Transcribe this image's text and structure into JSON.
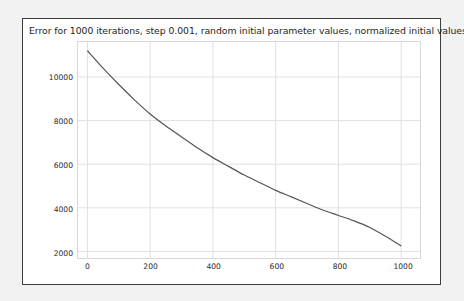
{
  "figure": {
    "background_color": "#ffffff",
    "outer_background_color": "#f2f2f2",
    "border_color": "#3d3d3d"
  },
  "chart_data": {
    "type": "line",
    "title": "Error for 1000 iterations, step 0.001, random initial parameter values, normalized initial values",
    "xlabel": "",
    "ylabel": "",
    "xlim": [
      -30,
      1060
    ],
    "ylim": [
      1700,
      11600
    ],
    "grid": true,
    "legend": null,
    "line_color": "#555555",
    "grid_color": "#e0e0e0",
    "xticks": [
      0,
      200,
      400,
      600,
      800,
      1000
    ],
    "xtick_labels": [
      "0",
      "200",
      "400",
      "600",
      "800",
      "1000"
    ],
    "yticks": [
      2000,
      4000,
      6000,
      8000,
      10000
    ],
    "ytick_labels": [
      "2000",
      "4000",
      "6000",
      "8000",
      "10000"
    ],
    "series": [
      {
        "name": "error",
        "x": [
          0,
          50,
          100,
          150,
          200,
          250,
          300,
          350,
          400,
          450,
          500,
          550,
          600,
          650,
          700,
          750,
          800,
          850,
          900,
          950,
          1000
        ],
        "values": [
          11200,
          10400,
          9650,
          8950,
          8300,
          7750,
          7250,
          6750,
          6300,
          5900,
          5500,
          5150,
          4800,
          4500,
          4200,
          3900,
          3650,
          3400,
          3100,
          2700,
          2250
        ]
      }
    ]
  }
}
